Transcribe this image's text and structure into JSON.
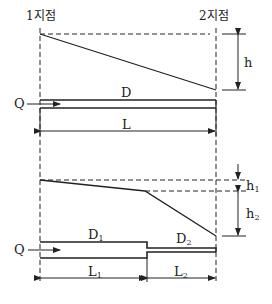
{
  "diagram": {
    "type": "pipe head-loss schematic",
    "points": {
      "start_label": "1지점",
      "end_label": "2지점"
    },
    "upper": {
      "pipe_label": "D",
      "length_label": "L",
      "head_label": "h",
      "flow_label": "Q"
    },
    "lower": {
      "pipe1_label": "D",
      "pipe1_sub": "1",
      "pipe2_label": "D",
      "pipe2_sub": "2",
      "length1_label": "L",
      "length1_sub": "1",
      "length2_label": "L",
      "length2_sub": "2",
      "head1_label": "h",
      "head1_sub": "1",
      "head2_label": "h",
      "head2_sub": "2",
      "flow_label": "Q"
    },
    "colors": {
      "line": "#222222",
      "background": "#ffffff"
    }
  }
}
